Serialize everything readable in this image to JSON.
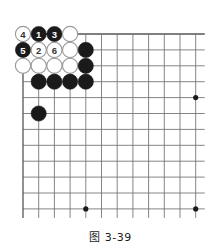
{
  "figure": {
    "caption": "图 3-39",
    "type": "go-board-diagram"
  },
  "board": {
    "columns": 12,
    "rows": 12,
    "origin_x": 23,
    "origin_y": 34,
    "spacing_x": 15.7,
    "spacing_y": 15.9,
    "line_color": "#777777",
    "edge_color": "#555555",
    "background": "#ffffff",
    "stone_radius": 7.6,
    "black_color": "#1a1a1a",
    "white_color": "#ffffff",
    "white_outline": "#999999",
    "star_points": [
      {
        "col": 12,
        "row": 5
      },
      {
        "col": 5,
        "row": 12
      },
      {
        "col": 12,
        "row": 12
      }
    ]
  },
  "chart_data": {
    "type": "go-board",
    "title": "图 3-39",
    "xlabel": "",
    "ylabel": "",
    "grid": true,
    "board_size": {
      "cols": 12,
      "rows": 12
    },
    "star_points": [
      [
        12,
        5
      ],
      [
        5,
        12
      ],
      [
        12,
        12
      ]
    ],
    "stones": [
      {
        "col": 1,
        "row": 1,
        "color": "white",
        "label": "4"
      },
      {
        "col": 2,
        "row": 1,
        "color": "black",
        "label": "1"
      },
      {
        "col": 3,
        "row": 1,
        "color": "black",
        "label": "3"
      },
      {
        "col": 4,
        "row": 1,
        "color": "white",
        "label": ""
      },
      {
        "col": 1,
        "row": 2,
        "color": "black",
        "label": "5"
      },
      {
        "col": 2,
        "row": 2,
        "color": "white",
        "label": "2"
      },
      {
        "col": 3,
        "row": 2,
        "color": "white",
        "label": "6"
      },
      {
        "col": 4,
        "row": 2,
        "color": "white",
        "label": ""
      },
      {
        "col": 5,
        "row": 2,
        "color": "black",
        "label": ""
      },
      {
        "col": 1,
        "row": 3,
        "color": "white",
        "label": ""
      },
      {
        "col": 2,
        "row": 3,
        "color": "white",
        "label": ""
      },
      {
        "col": 3,
        "row": 3,
        "color": "white",
        "label": ""
      },
      {
        "col": 4,
        "row": 3,
        "color": "white",
        "label": ""
      },
      {
        "col": 5,
        "row": 3,
        "color": "black",
        "label": ""
      },
      {
        "col": 2,
        "row": 4,
        "color": "black",
        "label": ""
      },
      {
        "col": 3,
        "row": 4,
        "color": "black",
        "label": ""
      },
      {
        "col": 4,
        "row": 4,
        "color": "black",
        "label": ""
      },
      {
        "col": 5,
        "row": 4,
        "color": "black",
        "label": ""
      },
      {
        "col": 2,
        "row": 6,
        "color": "black",
        "label": ""
      }
    ],
    "move_sequence": [
      {
        "number": "1",
        "color": "black",
        "col": 2,
        "row": 1
      },
      {
        "number": "2",
        "color": "white",
        "col": 2,
        "row": 2
      },
      {
        "number": "3",
        "color": "black",
        "col": 3,
        "row": 1
      },
      {
        "number": "4",
        "color": "white",
        "col": 1,
        "row": 1
      },
      {
        "number": "5",
        "color": "black",
        "col": 1,
        "row": 2
      },
      {
        "number": "6",
        "color": "white",
        "col": 3,
        "row": 2
      }
    ]
  }
}
